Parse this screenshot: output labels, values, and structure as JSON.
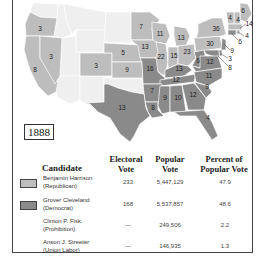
{
  "colors": {
    "republican": "#bdbdbd",
    "democrat": "#8a8a8a",
    "territory": "#f0f0f0",
    "border": "#ffffff",
    "frame": "#444444"
  },
  "map": {
    "year": "1888",
    "labels": [
      {
        "state": "OR",
        "votes": "3"
      },
      {
        "state": "CA",
        "votes": "8"
      },
      {
        "state": "NV",
        "votes": "3"
      },
      {
        "state": "CO",
        "votes": "3"
      },
      {
        "state": "NE",
        "votes": "5"
      },
      {
        "state": "KS",
        "votes": "9"
      },
      {
        "state": "MN",
        "votes": "7"
      },
      {
        "state": "IA",
        "votes": "13"
      },
      {
        "state": "WI",
        "votes": "11"
      },
      {
        "state": "MI",
        "votes": "13"
      },
      {
        "state": "IL",
        "votes": "22"
      },
      {
        "state": "IN",
        "votes": "15"
      },
      {
        "state": "OH",
        "votes": "23"
      },
      {
        "state": "PA",
        "votes": "30"
      },
      {
        "state": "NY",
        "votes": "36"
      },
      {
        "state": "ME",
        "votes": "6"
      },
      {
        "state": "NH",
        "votes": "4"
      },
      {
        "state": "VT",
        "votes": "4"
      },
      {
        "state": "MA",
        "votes": "14"
      },
      {
        "state": "RI",
        "votes": "4"
      },
      {
        "state": "CT",
        "votes": "6"
      },
      {
        "state": "NJ",
        "votes": "9"
      },
      {
        "state": "DE",
        "votes": "3"
      },
      {
        "state": "MD",
        "votes": "8"
      },
      {
        "state": "WV",
        "votes": "6"
      },
      {
        "state": "VA",
        "votes": "12"
      },
      {
        "state": "MO",
        "votes": "16"
      },
      {
        "state": "KY",
        "votes": "13"
      },
      {
        "state": "TN",
        "votes": "12"
      },
      {
        "state": "NC",
        "votes": "11"
      },
      {
        "state": "AR",
        "votes": "7"
      },
      {
        "state": "TX",
        "votes": "13"
      },
      {
        "state": "LA",
        "votes": "8"
      },
      {
        "state": "MS",
        "votes": "9"
      },
      {
        "state": "AL",
        "votes": "10"
      },
      {
        "state": "GA",
        "votes": "12"
      },
      {
        "state": "SC",
        "votes": "9"
      },
      {
        "state": "FL",
        "votes": "4"
      }
    ]
  },
  "table": {
    "headers": {
      "candidate": "Candidate",
      "electoral_1": "Electoral",
      "electoral_2": "Vote",
      "popular_1": "Popular",
      "popular_2": "Vote",
      "percent_1": "Percent of",
      "percent_2": "Popular Vote"
    },
    "rows": [
      {
        "name": "Benjamin Harrison",
        "party": "(Republican)",
        "electoral": "233",
        "popular": "5,447,129",
        "percent": "47.9",
        "swatch": "republican"
      },
      {
        "name": "Grover Cleveland",
        "party": "(Democrat)",
        "electoral": "168",
        "popular": "5,537,857",
        "percent": "48.6",
        "swatch": "democrat"
      },
      {
        "name": "Clinton P. Fisk",
        "party": "(Prohibition)",
        "electoral": "—",
        "popular": "249,506",
        "percent": "2.2",
        "swatch": ""
      },
      {
        "name": "Anson J. Streeter",
        "party": "(Union Labor)",
        "electoral": "—",
        "popular": "146,935",
        "percent": "1.3",
        "swatch": ""
      }
    ]
  }
}
